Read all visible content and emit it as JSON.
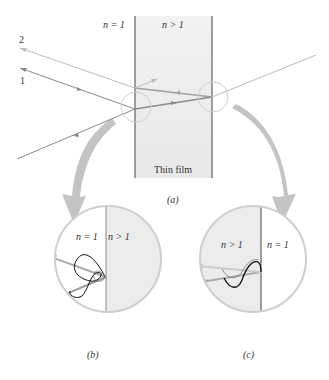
{
  "figure": {
    "panel_a": {
      "left_medium_label": "n = 1",
      "film_label": "n > 1",
      "film_name": "Thin film",
      "ray_labels": [
        "2",
        "1"
      ],
      "caption": "(a)"
    },
    "panel_b": {
      "left_label": "n = 1",
      "right_label": "n > 1",
      "caption": "(b)"
    },
    "panel_c": {
      "left_label": "n > 1",
      "right_label": "n = 1",
      "caption": "(c)"
    },
    "colors": {
      "film_fill": "#ececec",
      "ray_dark": "#8a8a8a",
      "ray_light": "#bdbdbd",
      "circle": "#cfcfcf",
      "arrow": "#c4c4c4",
      "line": "#444444",
      "wave": "#111111"
    }
  }
}
